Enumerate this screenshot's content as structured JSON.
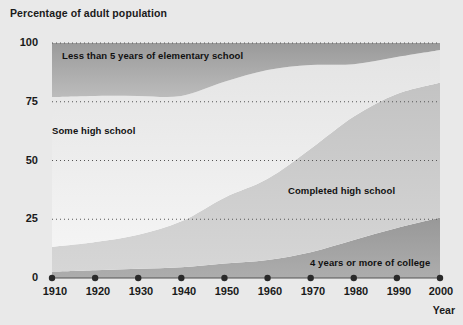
{
  "figure": {
    "title": "Percentage of adult population",
    "background_color": "#e9e9e9",
    "plot_background_color": "#ffffff"
  },
  "axes": {
    "x_axis_label": "Year",
    "y_ticks": [
      "0",
      "25",
      "50",
      "75",
      "100"
    ],
    "x_ticks": [
      "1910",
      "1920",
      "1930",
      "1940",
      "1950",
      "1960",
      "1970",
      "1980",
      "1990",
      "2000"
    ]
  },
  "band_labels": {
    "elementary": "Less than 5 years of elementary school",
    "some_high_school": "Some high school",
    "completed_high_school": "Completed high school",
    "college": "4 years or more of college"
  },
  "colors": {
    "band_elementary": "#a6a6a6",
    "band_some_high_school": "#ececec",
    "band_completed_high_school": "#c9c9c9",
    "band_college": "#a2a2a2",
    "gridline": "#555555",
    "marker": "#2a2a2a",
    "text": "#1a1a1a"
  },
  "chart_data": {
    "type": "area",
    "title": "Percentage of adult population",
    "xlabel": "Year",
    "ylabel": "Percentage of adult population",
    "xlim": [
      1910,
      2000
    ],
    "ylim": [
      0,
      100
    ],
    "grid": true,
    "stacked": true,
    "legend": "inline-band-labels",
    "x": [
      1910,
      1920,
      1930,
      1940,
      1950,
      1960,
      1970,
      1980,
      1990,
      2000
    ],
    "series": [
      {
        "name": "4 years or more of college",
        "values": [
          2.7,
          3.3,
          3.9,
          4.6,
          6.2,
          7.7,
          11.0,
          16.2,
          21.3,
          25.6
        ]
      },
      {
        "name": "Completed high school",
        "values": [
          10.5,
          12.0,
          14.5,
          19.5,
          28.0,
          34.5,
          44.0,
          52.5,
          57.0,
          57.5
        ]
      },
      {
        "name": "Some high school",
        "values": [
          63.8,
          62.2,
          59.1,
          53.4,
          49.3,
          46.3,
          35.6,
          22.3,
          15.7,
          13.9
        ]
      },
      {
        "name": "Less than 5 years of elementary school",
        "values": [
          23.0,
          22.5,
          22.5,
          22.5,
          16.5,
          11.5,
          9.4,
          9.0,
          6.0,
          3.0
        ]
      }
    ],
    "cumulative_boundaries": {
      "college_top": [
        2.7,
        3.3,
        3.9,
        4.6,
        6.2,
        7.7,
        11.0,
        16.2,
        21.3,
        25.6
      ],
      "completed_high_school_top": [
        13.2,
        15.3,
        18.4,
        24.1,
        34.2,
        42.2,
        55.0,
        68.7,
        78.3,
        83.1
      ],
      "some_high_school_top": [
        77.0,
        77.5,
        77.5,
        77.5,
        83.5,
        88.5,
        90.6,
        91.0,
        94.0,
        97.0
      ],
      "elementary_top": [
        100,
        100,
        100,
        100,
        100,
        100,
        100,
        100,
        100,
        100
      ]
    }
  }
}
